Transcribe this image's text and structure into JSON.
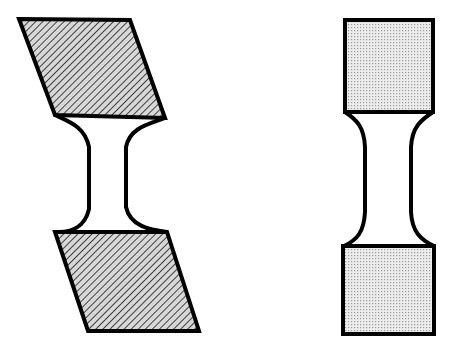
{
  "figure": {
    "background_color": "#ffffff",
    "outline_color": "#000000",
    "canvas": {
      "width": 449,
      "height": 348
    }
  },
  "specimens": [
    {
      "id": "sheared-specimen",
      "label": "Sheared specimen",
      "fill_style": "diagonal-hatch",
      "fill_color": "#d2d2d2",
      "hatch_color": "#1a1a1a",
      "outline_color": "#000000",
      "outline_width": 4,
      "parts": [
        {
          "id": "upper-grip",
          "label": "Upper grip (parallelogram)",
          "shape": "parallelogram",
          "points": "19,19 130,20 165,118 55,115"
        },
        {
          "id": "gauge-neck",
          "label": "Gauge section neck",
          "shape": "neck",
          "path": "M55,115 C70,122 86,128 89,148 L89,210 C86,228 72,234 55,232 L167,232 C150,230 129,224 126,206 L126,146 C129,128 148,122 165,118 Z"
        },
        {
          "id": "lower-grip",
          "label": "Lower grip (parallelogram)",
          "shape": "parallelogram",
          "points": "55,232 167,232 199,331 88,331"
        }
      ]
    },
    {
      "id": "undeformed-specimen",
      "label": "Undeformed specimen",
      "fill_style": "stipple-dots",
      "fill_color": "#ebebeb",
      "dot_color": "#8a8a8a",
      "outline_color": "#000000",
      "outline_width": 4,
      "parts": [
        {
          "id": "upper-grip",
          "label": "Upper grip (rectangle)",
          "shape": "rectangle",
          "points": "345,20 433,20 433,112 345,112"
        },
        {
          "id": "gauge-neck",
          "label": "Gauge section neck",
          "shape": "neck",
          "path": "M345,112 C358,119 364,126 365,146 L365,212 C364,232 358,240 345,246 L434,246 C421,240 412,232 411,212 L411,146 C412,126 421,119 433,112 Z"
        },
        {
          "id": "lower-grip",
          "label": "Lower grip (rectangle)",
          "shape": "rectangle",
          "points": "343,246 434,246 434,334 343,334"
        }
      ]
    }
  ]
}
